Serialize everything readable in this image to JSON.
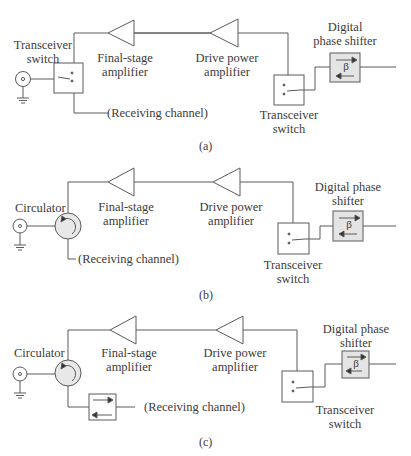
{
  "diagrams": [
    {
      "id": "a",
      "caption": "(a)",
      "labels": {
        "antenna_switch": [
          "Transceiver",
          "switch"
        ],
        "final_amp": [
          "Final-stage",
          "amplifier"
        ],
        "drive_amp": [
          "Drive power",
          "amplifier"
        ],
        "phase_shifter": [
          "Digital",
          "phase shifter"
        ],
        "tr_switch": [
          "Transceiver",
          "switch"
        ],
        "receiving": "(Receiving channel)"
      }
    },
    {
      "id": "b",
      "caption": "(b)",
      "labels": {
        "circulator": "Circulator",
        "final_amp": [
          "Final-stage",
          "amplifier"
        ],
        "drive_amp": [
          "Drive power",
          "amplifier"
        ],
        "phase_shifter": [
          "Digital phase",
          "shifter"
        ],
        "tr_switch": [
          "Transceiver",
          "switch"
        ],
        "receiving": "(Receiving channel)"
      }
    },
    {
      "id": "c",
      "caption": "(c)",
      "labels": {
        "circulator": "Circulator",
        "final_amp": [
          "Final-stage",
          "amplifier"
        ],
        "drive_amp": [
          "Drive power",
          "amplifier"
        ],
        "phase_shifter": [
          "Digital phase",
          "shifter"
        ],
        "tr_switch": [
          "Transceiver",
          "switch"
        ],
        "receiving": "(Receiving channel)"
      }
    }
  ],
  "symbols": {
    "phase": "β"
  },
  "colors": {
    "line": "#5a5a5a",
    "box_fill": "#e4e4e4",
    "circulator_fill": "#e8e8e8"
  }
}
